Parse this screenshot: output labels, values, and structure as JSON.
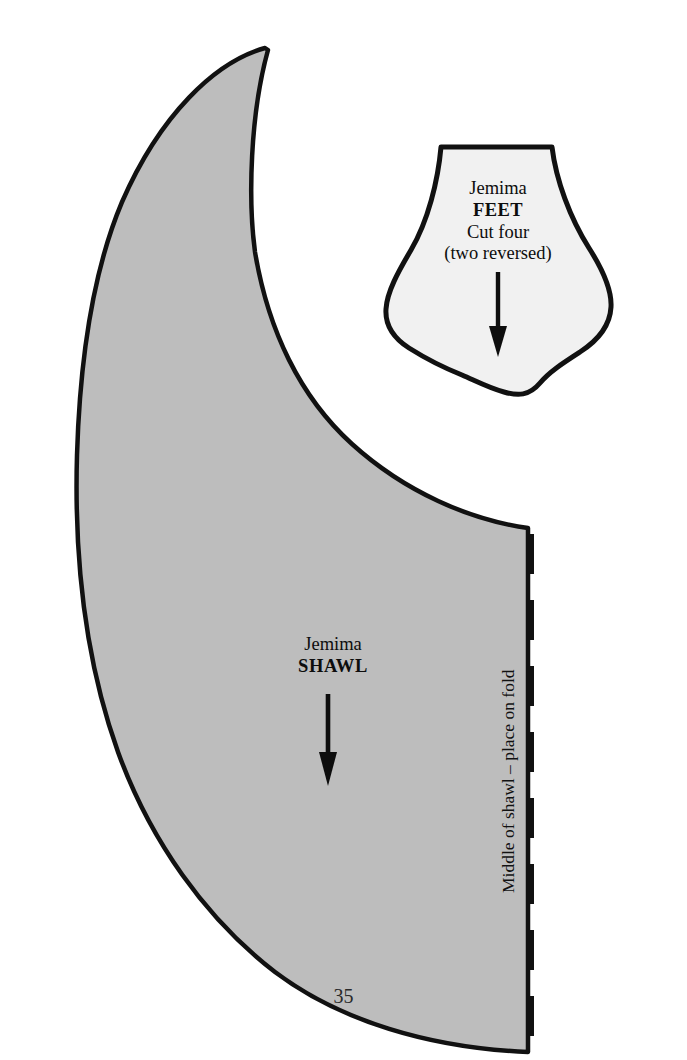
{
  "page": {
    "number": "35",
    "background_color": "#ffffff"
  },
  "pieces": {
    "feet": {
      "name": "feet-pattern-piece",
      "fill_color": "#f1f1f1",
      "outline_color": "#111111",
      "labels": {
        "character": "Jemima",
        "part": "FEET",
        "cut_instruction": "Cut four",
        "cut_note": "(two reversed)"
      },
      "grainline_arrow": "grainline-arrow-down"
    },
    "shawl": {
      "name": "shawl-pattern-piece",
      "fill_color": "#bdbdbd",
      "outline_color": "#111111",
      "labels": {
        "character": "Jemima",
        "part": "SHAWL"
      },
      "grainline_arrow": "grainline-arrow-down",
      "fold_line": {
        "text": "Middle of shawl – place on fold",
        "style": "dashed",
        "color": "#111111"
      }
    }
  }
}
